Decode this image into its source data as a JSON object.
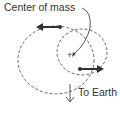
{
  "diagram": {
    "label_center_of_mass": "Center of mass",
    "label_to_earth": "To Earth",
    "center_marker": "+",
    "colors": {
      "ink": "#333333",
      "orbit": "#555555"
    }
  }
}
